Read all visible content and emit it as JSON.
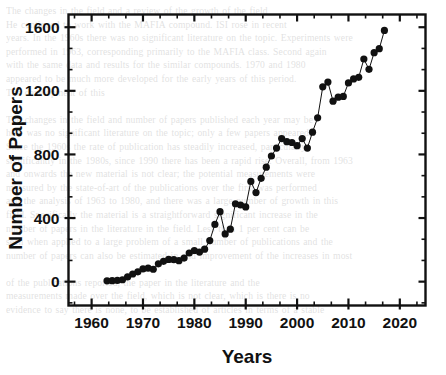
{
  "page": {
    "background_color": "#ffffff",
    "bleed_through_text": "The changes in the field and a review of the growth of the field\nHe continued to work with the MAFIA compound. ISI rose in recent\nyears. In the 1960s there was no significant literature on the topic. Experiments were\nperformed in 1963, corresponding primarily to the MAFIA class. Second again\nwith the same data and results for the similar compounds. 1970 and 1980\nappeared to be much more developed for the early years of this period.\nThe development of this\n\nThe changes in the field and number of papers published each year may be\nhere was no significant literature on the topic; only a few papers appeared.\nSince the 1960s the rate of publication has steadily increased, particularly\nsignificantly in the 1980s, since 1990 there has been a rapid rise. Overall, from 1963\nand onwards the new material is not clear; the potential measurements were\nmeasured by the state-of-art of the publications over the first was performed\nand the analysis of 1963 to 1980, and there was a large number of growth in this\nfield. Specifically the material is a straightforward significant increase in the\nnumber of papers in the literature in the field. Less than 1 per cent can be\nseen when applied to a large problem of a small number of publications and the\nnumber of papers can also be estimated in and improvement of the increases in most\n\nof the publications reported, the paper in the literature and the\nmeasurements made over the field, which is not clear, which is there is no\nevidence to say there is none, to be established of articles in terms of a stable"
  },
  "chart_data": {
    "type": "scatter",
    "line_connected": true,
    "title": "",
    "xlabel": "Years",
    "ylabel": "Number of Papers",
    "xlim": [
      1955.5,
      2025.0
    ],
    "ylim": [
      -150,
      1680
    ],
    "xticks": [
      1960,
      1970,
      1980,
      1990,
      2000,
      2010,
      2020
    ],
    "yticks": [
      0,
      400,
      800,
      1200,
      1600
    ],
    "xtick_labels": [
      "1960",
      "1970",
      "1980",
      "1990",
      "2000",
      "2010",
      "2020"
    ],
    "ytick_labels": [
      "0",
      "400",
      "800",
      "1200",
      "1600"
    ],
    "x_minor_ticks_per_major": 2,
    "y_minor_ticks_per_major": 2,
    "grid": false,
    "legend": null,
    "marker": "filled-circle",
    "marker_color": "#111111",
    "marker_size_px": 7.2,
    "line_color": "#111111",
    "line_width_px": 1.0,
    "axis_color": "#111111",
    "x": [
      1963,
      1964,
      1965,
      1966,
      1967,
      1968,
      1969,
      1970,
      1971,
      1972,
      1973,
      1974,
      1975,
      1976,
      1977,
      1978,
      1979,
      1980,
      1981,
      1982,
      1983,
      1984,
      1985,
      1986,
      1987,
      1988,
      1989,
      1990,
      1991,
      1992,
      1993,
      1994,
      1995,
      1996,
      1997,
      1998,
      1999,
      2000,
      2001,
      2002,
      2003,
      2004,
      2005,
      2006,
      2007,
      2008,
      2009,
      2010,
      2011,
      2012,
      2013,
      2014,
      2015,
      2016,
      2017
    ],
    "y": [
      5,
      6,
      8,
      12,
      30,
      48,
      62,
      80,
      85,
      78,
      112,
      128,
      140,
      138,
      132,
      148,
      180,
      196,
      186,
      204,
      258,
      360,
      440,
      300,
      330,
      490,
      482,
      470,
      630,
      560,
      650,
      720,
      790,
      840,
      900,
      880,
      875,
      855,
      900,
      840,
      940,
      1030,
      1225,
      1255,
      1135,
      1160,
      1165,
      1250,
      1275,
      1285,
      1400,
      1335,
      1440,
      1465,
      1580
    ],
    "series_name": "Number of Papers"
  }
}
